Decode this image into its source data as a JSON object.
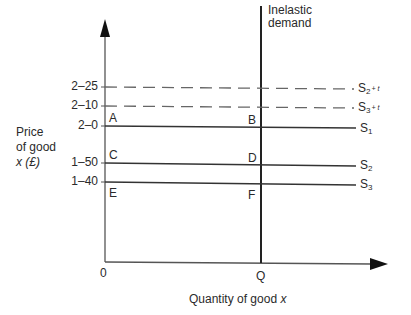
{
  "diagram": {
    "y_axis_label": [
      "Price",
      "of good",
      "x (£)"
    ],
    "x_axis_label": "Quantity of good x",
    "origin_label": "0",
    "quantity_label": "Q",
    "demand_label": [
      "Inelastic",
      "demand"
    ],
    "price_ticks": [
      {
        "label": "2–25",
        "value": 2.25
      },
      {
        "label": "2–10",
        "value": 2.1
      },
      {
        "label": "2–0",
        "value": 2.0
      },
      {
        "label": "1–50",
        "value": 1.5
      },
      {
        "label": "1–40",
        "value": 1.4
      }
    ],
    "points": [
      {
        "label": "A",
        "price": 2.0,
        "position": "y-axis"
      },
      {
        "label": "B",
        "price": 2.0,
        "position": "Q"
      },
      {
        "label": "C",
        "price": 1.5,
        "position": "y-axis"
      },
      {
        "label": "D",
        "price": 1.5,
        "position": "Q"
      },
      {
        "label": "E",
        "price": 1.4,
        "position": "y-axis"
      },
      {
        "label": "F",
        "price": 1.4,
        "position": "Q"
      }
    ],
    "supply_curves": [
      {
        "name": "S",
        "sub": "2",
        "tax": "+ t",
        "price": 2.25,
        "style": "dashed"
      },
      {
        "name": "S",
        "sub": "3",
        "tax": "+ t",
        "price": 2.1,
        "style": "dashed"
      },
      {
        "name": "S",
        "sub": "1",
        "tax": "",
        "price": 2.0,
        "style": "solid"
      },
      {
        "name": "S",
        "sub": "2",
        "tax": "",
        "price": 1.5,
        "style": "solid"
      },
      {
        "name": "S",
        "sub": "3",
        "tax": "",
        "price": 1.4,
        "style": "solid"
      }
    ]
  }
}
